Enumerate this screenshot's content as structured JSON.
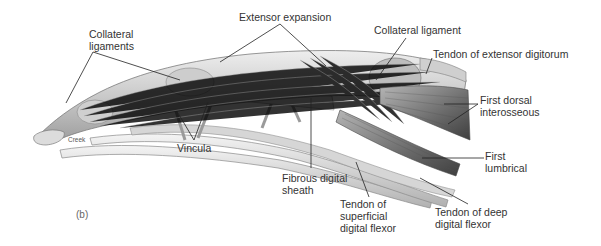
{
  "figure": {
    "panel_label": "(b)",
    "artist_signature": "Creek"
  },
  "colors": {
    "background": "#ffffff",
    "leader_line": "#222222",
    "label_text": "#333333",
    "tendon_light": "#d9d9d9",
    "tendon_mid": "#a8a8a8",
    "muscle_dark": "#5a5a5a"
  },
  "labels": [
    {
      "id": "collateral-ligaments",
      "text": "Collateral\nligaments",
      "x": 89,
      "y": 28
    },
    {
      "id": "extensor-expansion",
      "text": "Extensor expansion",
      "x": 239,
      "y": 12
    },
    {
      "id": "collateral-ligament",
      "text": "Collateral ligament",
      "x": 374,
      "y": 25
    },
    {
      "id": "tendon-extensor-digitorum",
      "text": "Tendon of extensor digitorum",
      "x": 433,
      "y": 49
    },
    {
      "id": "first-dorsal-interosseous",
      "text": "First dorsal\ninterosseous",
      "x": 480,
      "y": 95
    },
    {
      "id": "vincula",
      "text": "Vincula",
      "x": 177,
      "y": 143
    },
    {
      "id": "fibrous-digital-sheath",
      "text": "Fibrous digital\nsheath",
      "x": 282,
      "y": 173
    },
    {
      "id": "first-lumbrical",
      "text": "First\nlumbrical",
      "x": 485,
      "y": 151
    },
    {
      "id": "tendon-superficial-digital-flexor",
      "text": "Tendon of\nsuperficial\ndigital flexor",
      "x": 340,
      "y": 198
    },
    {
      "id": "tendon-deep-digital-flexor",
      "text": "Tendon of deep\ndigital flexor",
      "x": 435,
      "y": 205
    }
  ]
}
